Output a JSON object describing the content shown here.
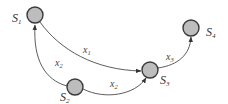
{
  "diagram": {
    "type": "directed-graph",
    "colors": {
      "node_fill": "#bdbdbd",
      "node_stroke": "#3a3a3a",
      "edge": "#4a4a4a",
      "text": "#333333"
    },
    "nodes": [
      {
        "id": "S1",
        "base": "S",
        "sub": "1"
      },
      {
        "id": "S2",
        "base": "S",
        "sub": "2"
      },
      {
        "id": "S3",
        "base": "S",
        "sub": "3"
      },
      {
        "id": "S4",
        "base": "S",
        "sub": "4"
      }
    ],
    "edges": [
      {
        "from": "S1",
        "to": "S3",
        "base": "x",
        "sub": "1"
      },
      {
        "from": "S2",
        "to": "S1",
        "base": "x",
        "sub": "2"
      },
      {
        "from": "S2",
        "to": "S3",
        "base": "x",
        "sub": "2"
      },
      {
        "from": "S3",
        "to": "S4",
        "base": "x",
        "sub": "3"
      }
    ]
  }
}
